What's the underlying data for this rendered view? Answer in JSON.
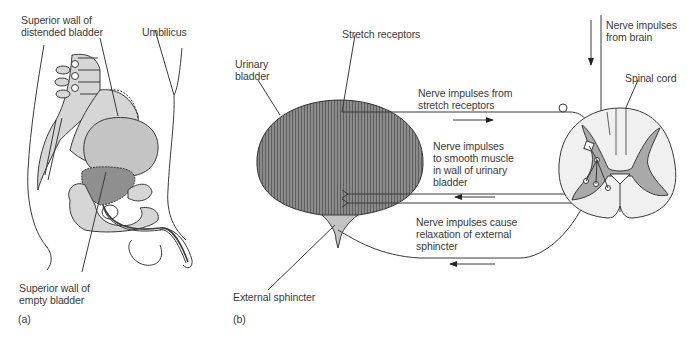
{
  "figure": {
    "panels": [
      {
        "id": "a",
        "marker": "(a)",
        "labels": {
          "distended": "Superior wall of\ndistended bladder",
          "umbilicus": "Umbilicus",
          "empty": "Superior wall of\nempty bladder"
        }
      },
      {
        "id": "b",
        "marker": "(b)",
        "labels": {
          "stretch_receptors": "Stretch receptors",
          "urinary_bladder": "Urinary\nbladder",
          "nerve_from_brain": "Nerve impulses\nfrom brain",
          "spinal_cord": "Spinal cord",
          "from_stretch": "Nerve impulses from\nstretch receptors",
          "to_smooth_muscle": "Nerve impulses\nto smooth muscle\nin wall of urinary\nbladder",
          "relaxation": "Nerve impulses cause\nrelaxation of external\nsphincter",
          "external_sphincter": "External sphincter"
        }
      }
    ],
    "colors": {
      "line": "#3a3a3a",
      "light_fill": "#d6d6d6",
      "medium_fill": "#bdbdbd",
      "dark_fill": "#8f8f8f",
      "bladder_fill": "#7a7a7a",
      "cord_white": "#f0f0f0",
      "cord_grey": "#a9a9a9"
    }
  }
}
